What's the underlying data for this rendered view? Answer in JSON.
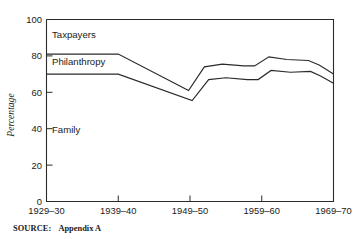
{
  "chart_data": {
    "type": "line",
    "title": "",
    "subtitle": "",
    "xlabel": "",
    "ylabel": "Percentage",
    "ylim": [
      0,
      100
    ],
    "yticks": [
      0,
      20,
      40,
      60,
      80,
      100
    ],
    "ytick_labels": [
      "0",
      "20",
      "40",
      "60",
      "80",
      "100"
    ],
    "xtick_labels": [
      "1929–30",
      "1939–40",
      "1949–50",
      "1959–60",
      "1969–70"
    ],
    "x": [
      1929,
      1939,
      1949,
      1959,
      1969
    ],
    "grid": false,
    "legend_position": "inline-band-labels",
    "band_labels": [
      {
        "text": "Taxpayers",
        "x_frac": 0.035,
        "value": 92
      },
      {
        "text": "Philanthropy",
        "x_frac": 0.035,
        "value": 77
      },
      {
        "text": "Family",
        "x_frac": 0.035,
        "value": 39
      }
    ],
    "series": [
      {
        "name": "Family + Philanthropy (upper boundary)",
        "points": [
          {
            "x": 1929.0,
            "y": 81.0
          },
          {
            "x": 1939.0,
            "y": 81.0
          },
          {
            "x": 1948.8,
            "y": 61.0
          },
          {
            "x": 1951.0,
            "y": 74.0
          },
          {
            "x": 1953.5,
            "y": 75.5
          },
          {
            "x": 1956.5,
            "y": 74.5
          },
          {
            "x": 1958.0,
            "y": 74.5
          },
          {
            "x": 1960.0,
            "y": 79.5
          },
          {
            "x": 1962.5,
            "y": 78.0
          },
          {
            "x": 1965.5,
            "y": 77.5
          },
          {
            "x": 1967.0,
            "y": 75.0
          },
          {
            "x": 1969.0,
            "y": 70.0
          }
        ]
      },
      {
        "name": "Family (lower boundary)",
        "points": [
          {
            "x": 1929.0,
            "y": 70.0
          },
          {
            "x": 1939.0,
            "y": 70.0
          },
          {
            "x": 1949.3,
            "y": 55.5
          },
          {
            "x": 1951.6,
            "y": 67.0
          },
          {
            "x": 1954.0,
            "y": 68.0
          },
          {
            "x": 1957.0,
            "y": 67.0
          },
          {
            "x": 1958.5,
            "y": 67.0
          },
          {
            "x": 1960.3,
            "y": 72.0
          },
          {
            "x": 1963.0,
            "y": 71.0
          },
          {
            "x": 1965.8,
            "y": 71.5
          },
          {
            "x": 1967.2,
            "y": 69.0
          },
          {
            "x": 1969.0,
            "y": 65.0
          }
        ]
      }
    ]
  },
  "source": {
    "label": "SOURCE:",
    "text": "Appendix A"
  },
  "colors": {
    "line": "#2b2b2b",
    "background": "#ffffff",
    "text": "#1a1a1a"
  }
}
